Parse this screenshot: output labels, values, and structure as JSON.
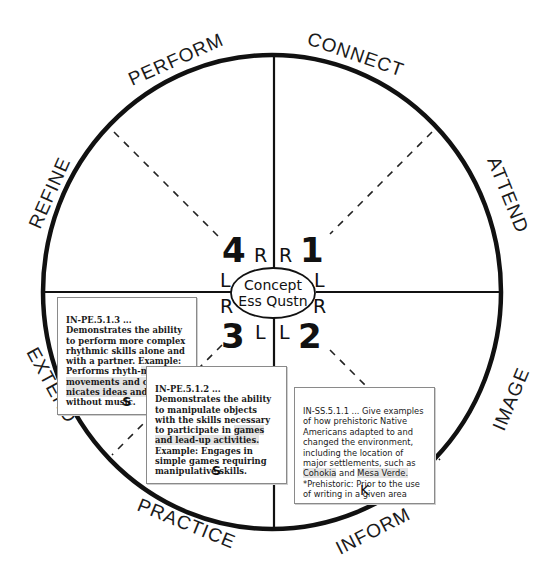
{
  "diagram": {
    "ring_labels": {
      "perform": "PERFORM",
      "connect": "CONNECT",
      "attend": "ATTEND",
      "image": "IMAGE",
      "inform": "INFORM",
      "practice": "PRACTICE",
      "extend": "EXTEND",
      "refine": "REFINE"
    },
    "quadrants": {
      "q1": "1",
      "q2": "2",
      "q3": "3",
      "q4": "4"
    },
    "side_letters": {
      "q4_right": "R",
      "q1_left": "R",
      "q4_bottom": "L",
      "q1_bottom": "L",
      "q3_top": "R",
      "q2_top": "R",
      "q3_right": "L",
      "q2_left": "L"
    },
    "center": {
      "line1": "Concept",
      "line2": "Ess Qustn"
    },
    "colors": {
      "stroke": "#111111",
      "card_border": "#8a8a8a",
      "highlight": "#e3e3e3"
    }
  },
  "cards": [
    {
      "code": "IN-PE.5.1.3",
      "text_before": " ... Demonstrates the ability to perform more complex rhythmic skills alone and with a partner. Example: Performs rhyth-",
      "text_highlight": "mic body movements and commu-nicates ideas and feelings",
      "text_after": " without music.",
      "tag": "S"
    },
    {
      "code": "IN-PE.5.1.2",
      "text_before": " ... Demonstrates the ability to manipulate objects with the skills necessary to participate in ",
      "text_highlight": "games and lead-up activities.",
      "text_after": " Example: Engages in simple games requiring manipulative skills.",
      "tag": "S"
    },
    {
      "code": "IN-SS.5.1.1",
      "text_before": "   ... Give examples of how prehistoric Native Americans adapted to and changed the environment, including the location of major settlements, such as ",
      "text_highlight": "Cohokia",
      "text_mid": " and ",
      "text_highlight2": "Mesa Verde.",
      "text_after": " *Prehistoric: Prior to the use of writing in a given area",
      "tag": "K"
    }
  ]
}
